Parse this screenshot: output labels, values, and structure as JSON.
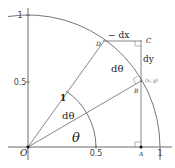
{
  "figure": {
    "type": "unit-circle-derivative-diagram",
    "axes": {
      "x_ticks": [
        "0.5",
        "1"
      ],
      "y_ticks": [
        "0.5",
        "1"
      ]
    },
    "points": {
      "origin": "O",
      "A": "A",
      "B": "B",
      "C": "C",
      "D": "D"
    },
    "labels": {
      "point_b_coords": "(x, y)",
      "radius": "1",
      "theta": "θ",
      "dtheta_angle": "dθ",
      "dtheta_arc": "dθ",
      "minus_dx": "− dx",
      "dy": "dy"
    },
    "colors": {
      "stroke": "#555555",
      "arc": "#777777",
      "point": "#111111"
    }
  }
}
